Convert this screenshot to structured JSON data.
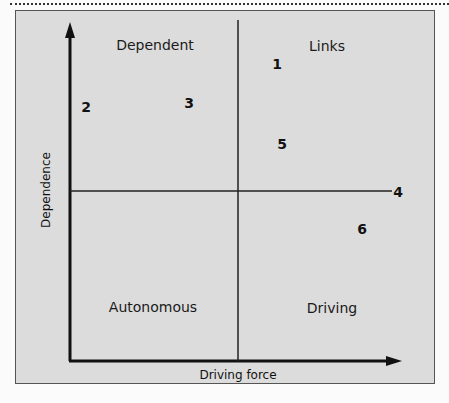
{
  "diagram": {
    "type": "MICMAC quadrant (dependence vs driving force)",
    "axes": {
      "x_label": "Driving force",
      "y_label": "Dependence"
    },
    "quadrants": {
      "top_left": "Dependent",
      "top_right": "Links",
      "bottom_left": "Autonomous",
      "bottom_right": "Driving"
    },
    "points": [
      {
        "label": "1",
        "quadrant": "Links"
      },
      {
        "label": "2",
        "quadrant": "Dependent"
      },
      {
        "label": "3",
        "quadrant": "Dependent"
      },
      {
        "label": "4",
        "quadrant": "Boundary (end of horizontal divider)"
      },
      {
        "label": "5",
        "quadrant": "Links"
      },
      {
        "label": "6",
        "quadrant": "Driving"
      }
    ]
  }
}
